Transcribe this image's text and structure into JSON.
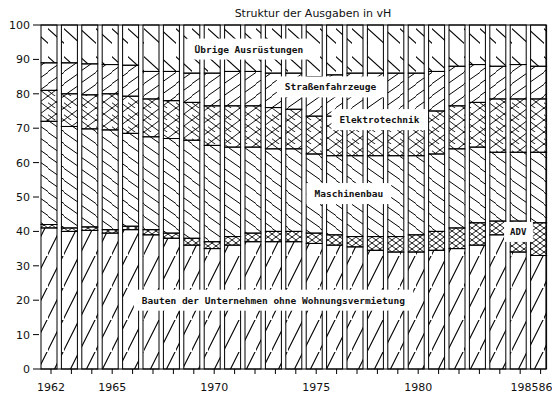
{
  "chart_data": {
    "type": "bar",
    "stacked": true,
    "title": "Struktur der Ausgaben in vH",
    "xlabel": "",
    "ylabel": "",
    "ylim": [
      0,
      100
    ],
    "yticks": [
      0,
      10,
      20,
      30,
      40,
      50,
      60,
      70,
      80,
      90,
      100
    ],
    "grid": false,
    "legend_position": "inline-labels",
    "categories": [
      "1962",
      "1963",
      "1964",
      "1965",
      "1966",
      "1967",
      "1968",
      "1969",
      "1970",
      "1971",
      "1972",
      "1973",
      "1974",
      "1975",
      "1976",
      "1977",
      "1978",
      "1979",
      "1980",
      "1981",
      "1982",
      "1983",
      "1984",
      "1985",
      "1986"
    ],
    "xtick_labels": [
      {
        "index": 0,
        "label": "1962"
      },
      {
        "index": 3,
        "label": "1965"
      },
      {
        "index": 8,
        "label": "1970"
      },
      {
        "index": 13,
        "label": "1975"
      },
      {
        "index": 18,
        "label": "1980"
      },
      {
        "index": 23,
        "label": "198586"
      }
    ],
    "series": [
      {
        "name": "Bauten der Unternehmen ohne Wohnungsvermietung",
        "pattern": "diag-up-sparse",
        "values": [
          41.0,
          40.0,
          40.3,
          39.5,
          40.5,
          39.0,
          38.0,
          36.0,
          35.0,
          36.0,
          37.0,
          37.0,
          37.0,
          36.5,
          36.0,
          35.5,
          34.5,
          34.0,
          34.0,
          34.5,
          35.0,
          36.0,
          39.0,
          34.0,
          33.0
        ]
      },
      {
        "name": "ADV",
        "pattern": "crosshatch",
        "values": [
          1.0,
          1.0,
          1.0,
          1.0,
          1.0,
          1.5,
          1.5,
          2.0,
          2.0,
          2.5,
          2.5,
          3.0,
          3.0,
          3.0,
          3.0,
          3.0,
          4.0,
          4.5,
          5.0,
          5.5,
          6.0,
          6.5,
          4.0,
          9.0,
          9.5
        ]
      },
      {
        "name": "Maschinenbau",
        "pattern": "diag-down-dense",
        "values": [
          30.0,
          29.5,
          28.5,
          29.0,
          27.0,
          27.0,
          27.5,
          28.5,
          28.0,
          26.0,
          25.0,
          24.0,
          24.0,
          23.0,
          23.0,
          23.5,
          23.5,
          23.5,
          23.0,
          22.5,
          23.0,
          22.0,
          20.0,
          20.0,
          20.5
        ]
      },
      {
        "name": "Elektrotechnik",
        "pattern": "crosshatch-diamond",
        "values": [
          9.0,
          9.5,
          9.9,
          10.5,
          10.8,
          11.0,
          11.0,
          11.0,
          11.5,
          12.0,
          12.0,
          12.0,
          11.5,
          11.0,
          11.5,
          12.5,
          12.5,
          12.5,
          12.5,
          12.5,
          12.5,
          13.0,
          15.5,
          15.5,
          15.5
        ]
      },
      {
        "name": "Straßenfahrzeuge",
        "pattern": "diag-up-dense",
        "values": [
          8.0,
          9.0,
          9.0,
          8.5,
          9.0,
          8.0,
          8.5,
          8.5,
          9.5,
          10.0,
          10.0,
          10.0,
          10.5,
          11.5,
          12.0,
          11.5,
          11.5,
          11.5,
          11.5,
          11.5,
          11.5,
          11.0,
          9.5,
          10.0,
          9.5
        ]
      },
      {
        "name": "Übrige Ausrüstungen",
        "pattern": "diag-down-sparse",
        "values": [
          11.0,
          11.0,
          11.3,
          11.5,
          11.7,
          13.5,
          13.5,
          14.0,
          14.0,
          13.5,
          13.5,
          14.0,
          14.0,
          15.0,
          14.5,
          14.0,
          14.0,
          14.0,
          14.0,
          13.5,
          12.0,
          11.5,
          12.0,
          11.5,
          12.0
        ]
      }
    ],
    "annotations": [
      {
        "text": "Übrige Ausrüstungen",
        "x_index": 9.8,
        "y": 93
      },
      {
        "text": "Straßenfahrzeuge",
        "x_index": 13.8,
        "y": 82
      },
      {
        "text": "Elektrotechnik",
        "x_index": 16.2,
        "y": 72.5
      },
      {
        "text": "Maschinenbau",
        "x_index": 14.7,
        "y": 51
      },
      {
        "text": "Bauten der Unternehmen ohne Wohnungsvermietung",
        "x_index": 11.0,
        "y": 20
      },
      {
        "text": "ADV",
        "x_index": 23.0,
        "y": 40
      }
    ]
  }
}
